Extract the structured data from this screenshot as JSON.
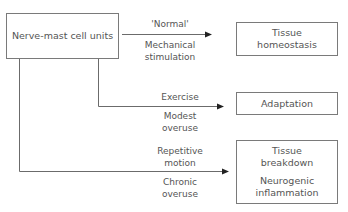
{
  "diagram": {
    "source": {
      "label": "Nerve-mast cell units"
    },
    "branches": [
      {
        "above": "'Normal'",
        "below_1": "Mechanical",
        "below_2": "stimulation",
        "target": {
          "line1": "Tissue",
          "line2": "homeostasis"
        }
      },
      {
        "above": "Exercise",
        "below_1": "Modest",
        "below_2": "overuse",
        "target": {
          "line1": "Adaptation"
        }
      },
      {
        "above_1": "Repetitive",
        "above_2": "motion",
        "below_1": "Chronic",
        "below_2": "overuse",
        "target": {
          "line1": "Tissue",
          "line2": "breakdown",
          "line3": "Neurogenic",
          "line4": "inflammation"
        }
      }
    ],
    "colors": {
      "line": "#6b6b6b",
      "arrowhead": "#222222",
      "text": "#555555",
      "border": "#7a7a7a"
    }
  }
}
